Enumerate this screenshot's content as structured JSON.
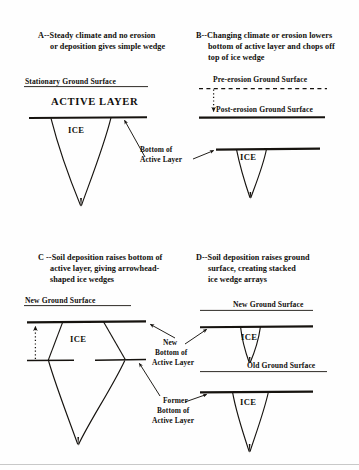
{
  "figure": {
    "ink_color": "#16130f",
    "background_color": "#fefefe"
  },
  "panels": [
    {
      "id": "A",
      "caption_letter": "A--",
      "caption_line1": "Steady climate and no erosion",
      "caption_line2": "or deposition gives simple wedge",
      "labels": {
        "ground_surface": "Stationary Ground Surface",
        "active_layer": "ACTIVE LAYER",
        "ice": "ICE",
        "annotation_line1": "Bottom of",
        "annotation_line2": "Active Layer"
      }
    },
    {
      "id": "B",
      "caption_letter": "B--",
      "caption_line1": "Changing climate or erosion lowers",
      "caption_line2": "bottom of active layer and chops off",
      "caption_line3": "top of ice wedge",
      "labels": {
        "pre_erosion_surface": "Pre-erosion Ground Surface",
        "post_erosion_surface": "Post-erosion Ground Surface",
        "ice": "ICE"
      }
    },
    {
      "id": "C",
      "caption_letter": "C --",
      "caption_line1": "Soil deposition raises  bottom of",
      "caption_line2": "active layer, giving arrowhead-",
      "caption_line3": "shaped ice wedges",
      "labels": {
        "ground_surface": "New Ground Surface",
        "ice": "ICE"
      }
    },
    {
      "id": "D",
      "caption_letter": "D--",
      "caption_line1": "Soil deposition raises ground",
      "caption_line2": "surface, creating stacked",
      "caption_line3": "ice wedge arrays",
      "labels": {
        "new_ground_surface": "New Ground Surface",
        "old_ground_surface": "Old Ground Surface",
        "ice_upper": "ICE",
        "ice_lower": "ICE"
      }
    }
  ],
  "shared_annotations": {
    "new_bottom_line1": "New",
    "new_bottom_line2": "Bottom of",
    "new_bottom_line3": "Active Layer",
    "former_bottom_line1": "Former",
    "former_bottom_line2": "Bottom of",
    "former_bottom_line3": "Active Layer"
  }
}
